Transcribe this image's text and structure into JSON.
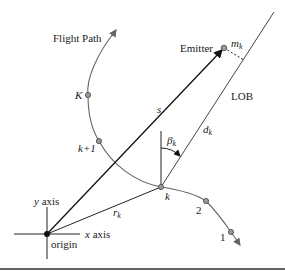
{
  "diagram": {
    "labels": {
      "flight_path": "Flight Path",
      "emitter": "Emitter",
      "m_k": "m",
      "m_k_sub": "k",
      "lob": "LOB",
      "s": "s",
      "d_k": "d",
      "d_k_sub": "k",
      "beta_k": "β",
      "beta_k_sub": "k",
      "r_k": "r",
      "r_k_sub": "k",
      "node_K": "K",
      "node_k_plus_1": "k+1",
      "node_k": "k",
      "node_2": "2",
      "node_1": "1",
      "y_axis": "y axis",
      "x_axis": "x axis",
      "origin": "origin"
    },
    "colors": {
      "line": "#222222",
      "path": "#666666",
      "node_fill": "#999999"
    }
  }
}
